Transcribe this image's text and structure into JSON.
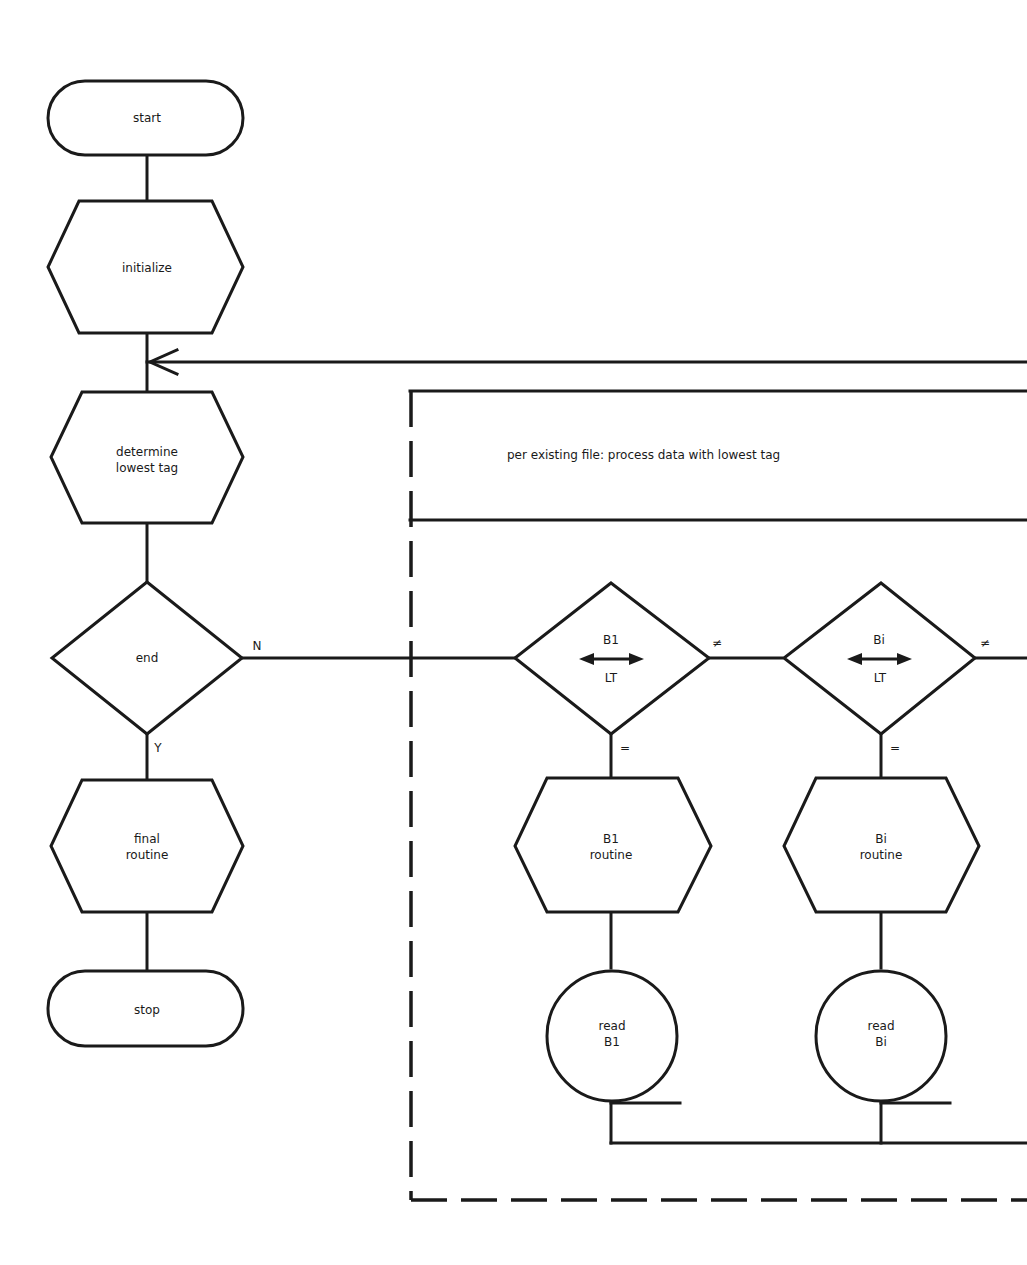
{
  "diagram": {
    "type": "flowchart",
    "main_flow": {
      "start": "start",
      "initialize": "initialize",
      "determine_line1": "determine",
      "determine_line2": "lowest tag",
      "end_decision": "end",
      "branch_no": "N",
      "branch_yes": "Y",
      "final_line1": "final",
      "final_line2": "routine",
      "stop": "stop"
    },
    "subprocess": {
      "note": "per existing file: process data with lowest tag",
      "decisions": [
        {
          "top": "B1",
          "bottom": "LT",
          "not_equal": "≠",
          "equal": "="
        },
        {
          "top": "Bi",
          "bottom": "LT",
          "not_equal": "≠",
          "equal": "="
        }
      ],
      "routines": [
        {
          "line1": "B1",
          "line2": "routine"
        },
        {
          "line1": "Bi",
          "line2": "routine"
        }
      ],
      "reads": [
        {
          "line1": "read",
          "line2": "B1"
        },
        {
          "line1": "read",
          "line2": "Bi"
        }
      ]
    }
  }
}
